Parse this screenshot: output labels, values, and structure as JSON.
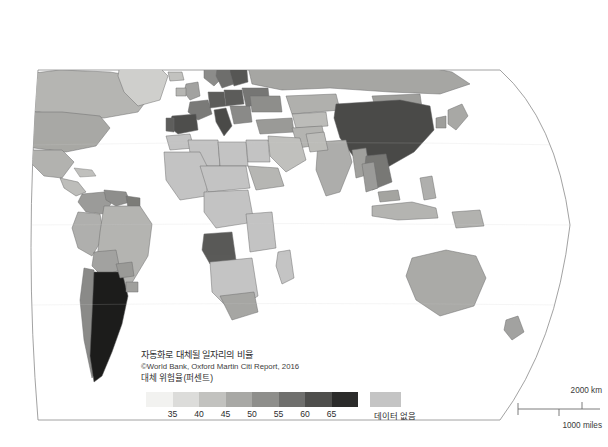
{
  "figure": {
    "name": "world-choropleth-automation-risk",
    "background_color": "#ffffff",
    "graticule_color": "#9a9a9a",
    "border_color": "#7d7d7d"
  },
  "legend": {
    "title": "자동화로 대체될 일자리의 비율",
    "source": "©World Bank, Oxford Martin Citi Report, 2016",
    "unit_label": "대체 위험율(퍼센트)",
    "no_data_label": "데이터 없음",
    "no_data_color": "#c4c4c4",
    "tick_labels": [
      "35",
      "40",
      "45",
      "50",
      "55",
      "60",
      "65"
    ],
    "swatch_colors": [
      "#f2f2f0",
      "#dcdcda",
      "#c2c2bf",
      "#a8a8a5",
      "#8e8e8b",
      "#6f6f6d",
      "#4e4e4c",
      "#2b2b2a"
    ]
  },
  "scalebar": {
    "km_label": "2000 km",
    "miles_label": "1000 miles",
    "line_color": "#6e6e6e"
  },
  "chart_data": {
    "type": "map",
    "title": "자동화로 대체될 일자리의 비율",
    "subtitle": "©World Bank, Oxford Martin Citi Report, 2016",
    "value_label": "대체 위험율(퍼센트)",
    "projection": "robinson-like",
    "scale_type": "sequential-gray",
    "bins": [
      {
        "max": 35,
        "color": "#f2f2f0"
      },
      {
        "min": 35,
        "max": 40,
        "color": "#dcdcda"
      },
      {
        "min": 40,
        "max": 45,
        "color": "#c2c2bf"
      },
      {
        "min": 45,
        "max": 50,
        "color": "#a8a8a5"
      },
      {
        "min": 50,
        "max": 55,
        "color": "#8e8e8b"
      },
      {
        "min": 55,
        "max": 60,
        "color": "#6f6f6d"
      },
      {
        "min": 60,
        "max": 65,
        "color": "#4e4e4c"
      },
      {
        "min": 65,
        "color": "#2b2b2a"
      }
    ],
    "no_data_color": "#c4c4c4",
    "regions": [
      {
        "name": "Argentina",
        "bin": 7,
        "color": "#1c1c1b"
      },
      {
        "name": "China",
        "bin": 7,
        "color": "#4a4a48"
      },
      {
        "name": "Spain",
        "bin": 6,
        "color": "#5a5a58"
      },
      {
        "name": "Italy",
        "bin": 6,
        "color": "#5e5e5c"
      },
      {
        "name": "Germany",
        "bin": 6,
        "color": "#5c5c5a"
      },
      {
        "name": "Poland",
        "bin": 6,
        "color": "#5c5c5a"
      },
      {
        "name": "Angola",
        "bin": 6,
        "color": "#5a5a58"
      },
      {
        "name": "Finland",
        "bin": 6,
        "color": "#565654"
      },
      {
        "name": "Brazil",
        "bin": 3,
        "color": "#b4b4b1"
      },
      {
        "name": "India",
        "bin": 3,
        "color": "#aeaeab"
      },
      {
        "name": "Australia",
        "bin": 3,
        "color": "#aaaaa7"
      },
      {
        "name": "United States",
        "bin": 3,
        "color": "#a8a8a5"
      },
      {
        "name": "Russia",
        "bin": 3,
        "color": "#a6a6a3"
      },
      {
        "name": "Africa (most)",
        "bin": -1,
        "color": "#c4c4c4"
      }
    ]
  }
}
